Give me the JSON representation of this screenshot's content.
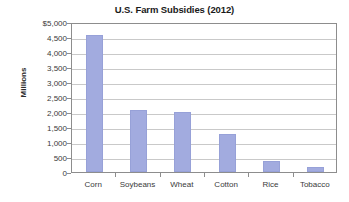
{
  "chart_data": {
    "type": "bar",
    "title": "U.S. Farm Subsidies (2012)",
    "xlabel": "",
    "ylabel": "Millions",
    "categories": [
      "Corn",
      "Soybeans",
      "Wheat",
      "Cotton",
      "Rice",
      "Tobacco"
    ],
    "values": [
      4580,
      2070,
      2010,
      1280,
      360,
      175
    ],
    "ylim": [
      0,
      5000
    ],
    "ytick_values": [
      0,
      500,
      1000,
      1500,
      2000,
      2500,
      3000,
      3500,
      4000,
      4500,
      5000
    ],
    "ytick_labels": [
      "0",
      "500",
      "1,000",
      "1,500",
      "2,000",
      "2,500",
      "3,000",
      "3,500",
      "4,000",
      "4,500",
      "$5,000"
    ],
    "grid": true,
    "legend": false,
    "legend_position": "none",
    "bar_color": "#a2abdf",
    "gridline_color": "#c9c9c9",
    "axis_color": "#8d8d8d",
    "background_color": "#ffffff"
  }
}
